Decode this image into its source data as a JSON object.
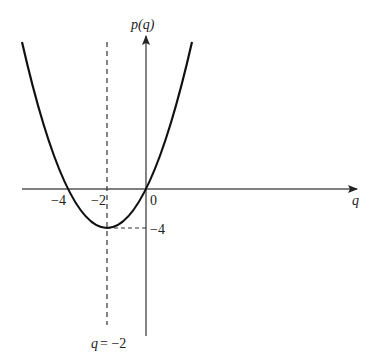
{
  "figure": {
    "function": "p(q) = q^2 + 4q",
    "y_axis_label": "p(q)",
    "x_axis_label": "q",
    "x_ticks": [
      {
        "value": -4,
        "label": "−4"
      },
      {
        "value": -2,
        "label": "−2"
      },
      {
        "value": 0,
        "label": "0"
      }
    ],
    "y_ticks": [
      {
        "value": -4,
        "label": "−4"
      }
    ],
    "vertex": {
      "q": -2,
      "p": -4
    },
    "axis_of_symmetry_label": "q = −2",
    "axis_of_symmetry_q": "q",
    "axis_of_symmetry_eq": "= −2",
    "colors": {
      "curve": "#111111",
      "axes": "#444444",
      "dashed": "#333333"
    }
  }
}
